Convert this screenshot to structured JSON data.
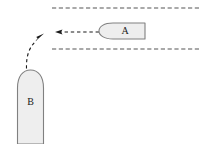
{
  "diagram": {
    "canvas": {
      "width": 201,
      "height": 144,
      "background": "#ffffff"
    },
    "style": {
      "vessel_fill": "#eeeeee",
      "vessel_stroke": "#808080",
      "lane_line_color": "#555555",
      "arrow_color": "#1a1a1a",
      "label_color": "#1a1a1a"
    },
    "vessels": [
      {
        "id": "vessel-a",
        "label": "A",
        "orientation": "horizontal",
        "heading": "west",
        "bow_side": "left",
        "x": 99,
        "y": 23,
        "width": 46,
        "height": 16
      },
      {
        "id": "vessel-b",
        "label": "B",
        "orientation": "vertical",
        "heading": "north",
        "bow_side": "top",
        "x": 17,
        "y": 70,
        "width": 27,
        "height": 74
      }
    ],
    "lane_lines": [
      {
        "id": "lane-line-top",
        "style": "dashed",
        "x1": 52,
        "y1": 8,
        "x2": 201,
        "y2": 8
      },
      {
        "id": "lane-line-bottom",
        "style": "dashed",
        "x1": 52,
        "y1": 49,
        "x2": 201,
        "y2": 49
      }
    ],
    "arrows": [
      {
        "id": "arrow-a-course",
        "style": "dashed",
        "shape": "straight",
        "direction": "left",
        "from": {
          "x": 100,
          "y": 32
        },
        "to": {
          "x": 56,
          "y": 32
        }
      },
      {
        "id": "arrow-b-course",
        "style": "dashed",
        "shape": "curved",
        "direction": "up-right",
        "from": {
          "x": 26,
          "y": 68
        },
        "to": {
          "x": 43,
          "y": 37
        }
      }
    ]
  }
}
